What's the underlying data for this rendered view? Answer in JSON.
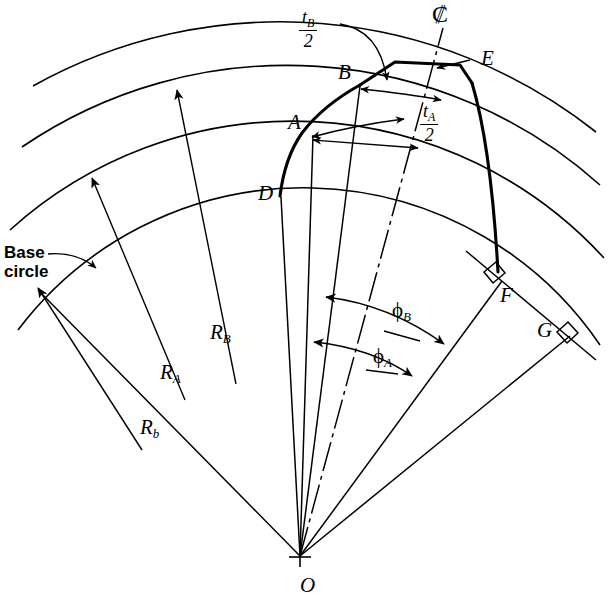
{
  "figure": {
    "domain": "engineering-diagram",
    "background_color": "#ffffff",
    "ink_color": "#000000"
  },
  "points": [
    {
      "id": "A",
      "label": "A",
      "desc": "point on involute at radius R_A"
    },
    {
      "id": "B",
      "label": "B",
      "desc": "point on involute at radius R_B"
    },
    {
      "id": "D",
      "label": "D",
      "desc": "involute start on base circle"
    },
    {
      "id": "E",
      "label": "E",
      "desc": "tooth top land corner on centerline"
    },
    {
      "id": "F",
      "label": "F",
      "desc": "tangent point, perpendicular to line of action"
    },
    {
      "id": "G",
      "label": "G",
      "desc": "tangent point, perpendicular to line of action"
    },
    {
      "id": "O",
      "label": "O",
      "desc": "gear center"
    }
  ],
  "radii": [
    {
      "id": "Rb",
      "sym": "R",
      "sub": "b",
      "desc": "base circle radius"
    },
    {
      "id": "RA",
      "sym": "R",
      "sub": "A",
      "desc": "radius to point A"
    },
    {
      "id": "RB",
      "sym": "R",
      "sub": "B",
      "desc": "radius to point B"
    }
  ],
  "angles": [
    {
      "id": "phiA",
      "sym": "ϕ",
      "sub": "A",
      "desc": "pressure angle at A"
    },
    {
      "id": "phiB",
      "sym": "ϕ",
      "sub": "B",
      "desc": "pressure angle at B"
    }
  ],
  "thickness": [
    {
      "id": "tB",
      "num_sym": "t",
      "num_sub": "B",
      "den": "2",
      "desc": "half tooth thickness at B"
    },
    {
      "id": "tA",
      "num_sym": "t",
      "num_sub": "A",
      "den": "2",
      "desc": "half tooth thickness at A"
    }
  ],
  "annotations": {
    "base_circle_line1": "Base",
    "base_circle_line2": "circle",
    "centerline_symbol": "₡"
  }
}
